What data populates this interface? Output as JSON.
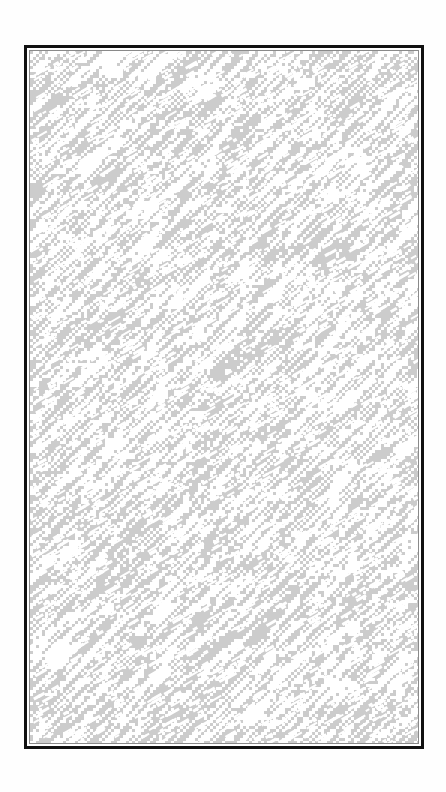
{
  "image": {
    "description": "Framed abstract diagonal noise texture",
    "frame": {
      "outer_border_color": "#111111",
      "inner_border_color": "#8a8a8a",
      "gap_color": "#ffffff"
    },
    "texture": {
      "base_color": "#cccccc",
      "highlight_color": "#ffffff",
      "direction": "diagonal, bottom-left to top-right",
      "seed": 1337
    },
    "background_color": "#fefefe"
  }
}
